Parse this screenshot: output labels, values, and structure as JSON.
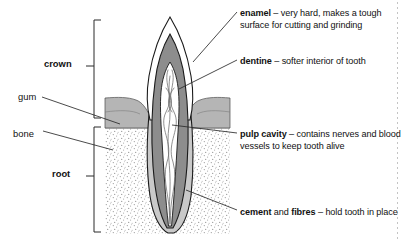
{
  "diagram": {
    "colors": {
      "outline": "#1a1a1a",
      "enamel": "#ffffff",
      "dentine": "#8d8d8d",
      "pulp": "#ffffff",
      "cement": "#c9c9c9",
      "gum": "#b5b5b5",
      "bone_stipple": "#9a9a9a",
      "bone_background": "#ffffff",
      "leader_line": "#2b2b2b",
      "text": "#111111"
    }
  },
  "callouts": {
    "enamel": {
      "term": "enamel",
      "dash": " – ",
      "description": "very hard, makes a tough surface for cutting and grinding"
    },
    "dentine": {
      "term": "dentine",
      "dash": " – ",
      "description": "softer interior of tooth"
    },
    "pulp_cavity": {
      "term": "pulp cavity",
      "dash": " – ",
      "description": "contains nerves and blood vessels to keep tooth alive"
    },
    "cement": {
      "term": "cement",
      "conjunction": " and ",
      "term2": "fibres",
      "dash": " – ",
      "description": "hold tooth in place"
    }
  },
  "side_labels": {
    "crown": "crown",
    "gum": "gum",
    "bone": "bone",
    "root": "root"
  }
}
